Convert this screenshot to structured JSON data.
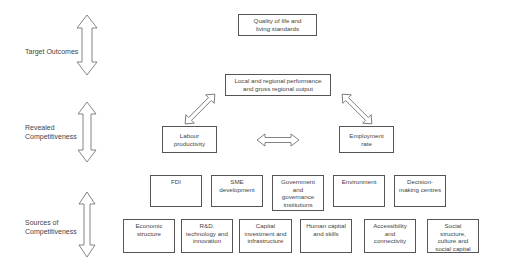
{
  "diagram": {
    "levels": [
      {
        "label": "Target Outcomes"
      },
      {
        "label": "Revealed\nCompetitiveness"
      },
      {
        "label": "Sources of\nCompetitiveness"
      }
    ],
    "top_box": "Quality of life and\nliving standards",
    "performance_box": "Local and regional performance\nand gross regional output",
    "labour_box": "Labour\nproductivity",
    "employment_box": "Employment\nrate",
    "sources_row1": [
      "FDI",
      "SME\ndevelopment",
      "Government\nand\ngovernance\ninstitutions",
      "Environment",
      "Decision-\nmaking centres"
    ],
    "sources_row2": [
      "Economic\nstructure",
      "R&D,\ntechnology and\ninnovation",
      "Capital\ninvestment and\ninfrastructure",
      "Human capital\nand skills",
      "Accessibility\nand\nconnectivity",
      "Social\nstructure,\nculture and\nsocial capital"
    ],
    "arrow_style": {
      "stroke": "#666666",
      "fill": "#ffffff"
    }
  }
}
